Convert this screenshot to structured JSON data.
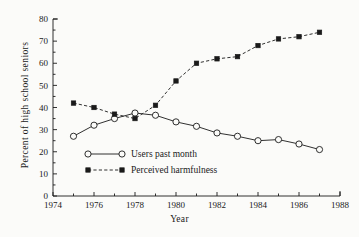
{
  "chart_data": {
    "type": "line",
    "title": "",
    "xlabel": "Year",
    "ylabel": "Percent of high school seniors",
    "xlim": [
      1974,
      1988
    ],
    "ylim": [
      0,
      80
    ],
    "grid": false,
    "legend_position": "inside-lower-left",
    "x_ticks_major": [
      1974,
      1976,
      1978,
      1980,
      1982,
      1984,
      1986,
      1988
    ],
    "x_ticks_minor": [
      1975,
      1977,
      1979,
      1981,
      1983,
      1985,
      1987
    ],
    "y_ticks": [
      0,
      10,
      20,
      30,
      40,
      50,
      60,
      70,
      80
    ],
    "x": [
      1975,
      1976,
      1977,
      1978,
      1979,
      1980,
      1981,
      1982,
      1983,
      1984,
      1985,
      1986,
      1987
    ],
    "series": [
      {
        "name": "Users past month",
        "marker": "open-circle",
        "linestyle": "solid",
        "color": "#1a1a1a",
        "values": [
          27,
          32,
          35,
          37.5,
          36.5,
          33.5,
          31.5,
          28.5,
          27,
          25,
          25.5,
          23.5,
          21
        ]
      },
      {
        "name": "Perceived harmfulness",
        "marker": "filled-square",
        "linestyle": "dashed",
        "color": "#1a1a1a",
        "values": [
          42,
          40,
          37,
          35,
          41,
          52,
          60,
          62,
          63,
          68,
          71,
          72,
          74
        ]
      }
    ]
  },
  "legend": {
    "entries": [
      {
        "label": "Users past month"
      },
      {
        "label": "Perceived harmfulness"
      }
    ]
  },
  "axes": {
    "x_title": "Year",
    "y_title": "Percent of high school seniors"
  }
}
